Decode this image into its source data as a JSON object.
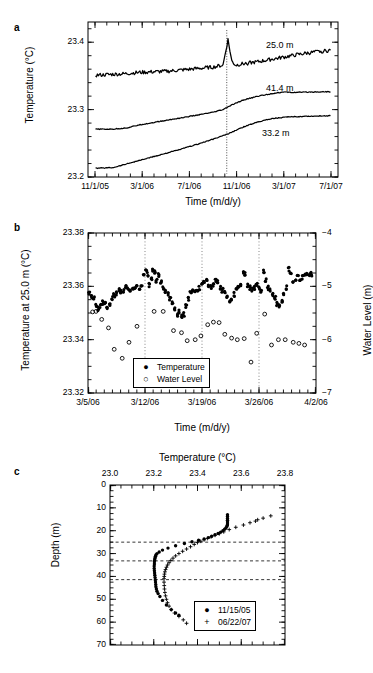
{
  "figure": {
    "panels": [
      "a",
      "b",
      "c"
    ]
  },
  "panel_a": {
    "label": "a",
    "ylabel": "Temperature (°C)",
    "xlabel": "Time (m/d/y)",
    "yticks": [
      "23.2",
      "23.3",
      "23.4"
    ],
    "xticks": [
      "11/1/05",
      "3/1/06",
      "7/1/06",
      "11/1/06",
      "3/1/07",
      "7/1/07"
    ],
    "series_labels": [
      "25.0 m",
      "41.4 m",
      "33.2 m"
    ],
    "chart_data": {
      "type": "line",
      "title": "",
      "xlabel": "Time (m/d/y)",
      "ylabel": "Temperature (°C)",
      "xlim": [
        "11/1/05",
        "7/1/07"
      ],
      "ylim": [
        23.2,
        23.43
      ],
      "yticks": [
        23.2,
        23.3,
        23.4
      ],
      "xtick_labels": [
        "11/1/05",
        "3/1/06",
        "7/1/06",
        "11/1/06",
        "3/1/07",
        "7/1/07"
      ],
      "grid": false,
      "legend": "inline-labels",
      "series": [
        {
          "name": "25.0 m",
          "noisy": true,
          "x": [
            0.03,
            0.08,
            0.14,
            0.2,
            0.26,
            0.32,
            0.38,
            0.44,
            0.5,
            0.54,
            0.56,
            0.575,
            0.59,
            0.62,
            0.68,
            0.74,
            0.8,
            0.86,
            0.92,
            0.97
          ],
          "y": [
            23.351,
            23.352,
            23.353,
            23.355,
            23.356,
            23.357,
            23.359,
            23.361,
            23.363,
            23.366,
            23.404,
            23.372,
            23.366,
            23.368,
            23.371,
            23.375,
            23.379,
            23.383,
            23.386,
            23.388
          ]
        },
        {
          "name": "41.4 m",
          "noisy": false,
          "x": [
            0.03,
            0.1,
            0.16,
            0.2,
            0.28,
            0.36,
            0.44,
            0.5,
            0.54,
            0.57,
            0.62,
            0.68,
            0.74,
            0.78,
            0.82,
            0.88,
            0.94,
            0.97
          ],
          "y": [
            23.271,
            23.271,
            23.273,
            23.277,
            23.282,
            23.287,
            23.292,
            23.296,
            23.3,
            23.306,
            23.314,
            23.32,
            23.324,
            23.326,
            23.3255,
            23.326,
            23.3265,
            23.3265
          ]
        },
        {
          "name": "33.2 m",
          "noisy": false,
          "x": [
            0.03,
            0.1,
            0.14,
            0.2,
            0.28,
            0.36,
            0.44,
            0.5,
            0.56,
            0.62,
            0.68,
            0.74,
            0.8,
            0.86,
            0.92,
            0.97
          ],
          "y": [
            23.213,
            23.214,
            23.218,
            23.224,
            23.232,
            23.24,
            23.249,
            23.256,
            23.264,
            23.274,
            23.282,
            23.287,
            23.289,
            23.29,
            23.2905,
            23.291
          ]
        }
      ],
      "annotations": [
        {
          "text": "dropout spike near 10/1/06",
          "x": 0.555
        }
      ]
    }
  },
  "panel_b": {
    "label": "b",
    "ylabel_left": "Temperature at 25.0 m (°C)",
    "ylabel_right": "Water Level (m)",
    "xlabel": "Time (m/d/y)",
    "yticks_left": [
      "23.38",
      "23.36",
      "23.34",
      "23.32"
    ],
    "yticks_right": [
      "−4",
      "−5",
      "−6",
      "−7"
    ],
    "xticks": [
      "3/5/06",
      "3/12/06",
      "3/19/06",
      "3/26/06",
      "4/2/06"
    ],
    "legend": [
      {
        "symbol": "●",
        "label": "Temperature"
      },
      {
        "symbol": "○",
        "label": "Water Level"
      }
    ],
    "chart_data": {
      "type": "scatter",
      "title": "",
      "xlabel": "Time (m/d/y)",
      "ylabel": "Temperature at 25.0 m (°C)",
      "ylabel_secondary": "Water Level (m)",
      "ylim": [
        23.32,
        23.38
      ],
      "ylim_secondary": [
        -7,
        -4
      ],
      "yticks": [
        23.32,
        23.34,
        23.36,
        23.38
      ],
      "yticks_secondary": [
        -7,
        -6,
        -5,
        -4
      ],
      "xtick_labels": [
        "3/5/06",
        "3/12/06",
        "3/19/06",
        "3/26/06",
        "4/2/06"
      ],
      "grid": "vertical-dotted",
      "legend_position": "lower-center",
      "series": [
        {
          "name": "Temperature",
          "marker": "filled-circle",
          "axis": "left",
          "x": [
            0.005,
            0.015,
            0.025,
            0.035,
            0.045,
            0.055,
            0.065,
            0.075,
            0.085,
            0.095,
            0.105,
            0.115,
            0.125,
            0.135,
            0.145,
            0.155,
            0.165,
            0.175,
            0.185,
            0.195,
            0.205,
            0.215,
            0.225,
            0.235,
            0.245,
            0.255,
            0.262,
            0.27,
            0.278,
            0.285,
            0.292,
            0.3,
            0.31,
            0.32,
            0.33,
            0.34,
            0.35,
            0.36,
            0.37,
            0.38,
            0.39,
            0.4,
            0.41,
            0.42,
            0.43,
            0.44,
            0.45,
            0.46,
            0.47,
            0.48,
            0.49,
            0.5,
            0.51,
            0.52,
            0.53,
            0.54,
            0.55,
            0.56,
            0.57,
            0.58,
            0.59,
            0.6,
            0.61,
            0.62,
            0.63,
            0.64,
            0.65,
            0.66,
            0.67,
            0.68,
            0.69,
            0.7,
            0.71,
            0.72,
            0.73,
            0.74,
            0.75,
            0.76,
            0.77,
            0.78,
            0.79,
            0.8,
            0.81,
            0.82,
            0.83,
            0.84,
            0.85,
            0.86,
            0.87,
            0.88,
            0.89,
            0.9,
            0.91,
            0.92,
            0.93,
            0.94,
            0.95,
            0.96,
            0.97,
            0.98
          ],
          "y": [
            23.3575,
            23.3565,
            23.3555,
            23.353,
            23.3515,
            23.3525,
            23.354,
            23.3535,
            23.352,
            23.3535,
            23.3555,
            23.3565,
            23.3575,
            23.3585,
            23.358,
            23.3585,
            23.3595,
            23.359,
            23.3585,
            23.3595,
            23.36,
            23.3595,
            23.3585,
            23.36,
            23.3645,
            23.3665,
            23.3645,
            23.3605,
            23.3625,
            23.366,
            23.3655,
            23.362,
            23.3645,
            23.3615,
            23.3595,
            23.3585,
            23.357,
            23.3555,
            23.3535,
            23.3515,
            23.3495,
            23.3505,
            23.349,
            23.3495,
            23.3525,
            23.3555,
            23.3575,
            23.3585,
            23.3585,
            23.359,
            23.3595,
            23.3605,
            23.3615,
            23.3625,
            23.3605,
            23.3595,
            23.3605,
            23.3625,
            23.3615,
            23.3595,
            23.3585,
            23.3575,
            23.356,
            23.3545,
            23.3555,
            23.357,
            23.3585,
            23.3595,
            23.3605,
            23.3655,
            23.3645,
            23.3605,
            23.3595,
            23.3585,
            23.3595,
            23.3605,
            23.3595,
            23.3585,
            23.3655,
            23.3625,
            23.3595,
            23.3585,
            23.357,
            23.3555,
            23.3535,
            23.3525,
            23.3545,
            23.3575,
            23.3595,
            23.3665,
            23.3645,
            23.3615,
            23.3625,
            23.3645,
            23.363,
            23.3635,
            23.364,
            23.3645,
            23.3645,
            23.3645
          ]
        },
        {
          "name": "Water Level",
          "marker": "open-circle",
          "axis": "right",
          "x": [
            0.02,
            0.035,
            0.06,
            0.09,
            0.115,
            0.15,
            0.18,
            0.215,
            0.29,
            0.33,
            0.375,
            0.41,
            0.435,
            0.47,
            0.495,
            0.525,
            0.55,
            0.575,
            0.6,
            0.63,
            0.655,
            0.685,
            0.715,
            0.74,
            0.775,
            0.805,
            0.835,
            0.865,
            0.9,
            0.925,
            0.95
          ],
          "y": [
            -5.48,
            -5.47,
            -5.62,
            -5.78,
            -6.18,
            -6.35,
            -6.05,
            -5.75,
            -5.47,
            -5.47,
            -5.83,
            -5.87,
            -6.02,
            -6.0,
            -5.93,
            -5.72,
            -5.67,
            -5.68,
            -5.9,
            -5.97,
            -6.0,
            -5.98,
            -6.42,
            -5.88,
            -5.52,
            -6.1,
            -6.0,
            -6.0,
            -6.05,
            -6.07,
            -6.1
          ]
        }
      ]
    }
  },
  "panel_c": {
    "label": "c",
    "xlabel": "Temperature (°C)",
    "ylabel": "Depth (m)",
    "xticks": [
      "23.0",
      "23.2",
      "23.4",
      "23.6",
      "23.8"
    ],
    "yticks": [
      "0",
      "10",
      "20",
      "30",
      "40",
      "50",
      "60",
      "70"
    ],
    "legend": [
      {
        "symbol": "●",
        "label": "11/15/05"
      },
      {
        "symbol": "+",
        "label": "06/22/07"
      }
    ],
    "chart_data": {
      "type": "scatter",
      "title": "",
      "xlabel": "Temperature (°C)",
      "ylabel": "Depth (m)",
      "xlim": [
        23.0,
        23.8
      ],
      "ylim": [
        70,
        0
      ],
      "xticks": [
        23.0,
        23.2,
        23.4,
        23.6,
        23.8
      ],
      "yticks": [
        0,
        10,
        20,
        30,
        40,
        50,
        60,
        70
      ],
      "x_axis_position": "top",
      "y_axis_inverted": true,
      "grid": false,
      "reference_lines_depth_m": [
        25.0,
        33.2,
        41.4
      ],
      "legend_position": "lower-right",
      "series": [
        {
          "name": "11/15/05",
          "marker": "filled-circle",
          "temperature": [
            23.537,
            23.537,
            23.537,
            23.537,
            23.537,
            23.537,
            23.536,
            23.534,
            23.53,
            23.524,
            23.516,
            23.506,
            23.494,
            23.48,
            23.465,
            23.45,
            23.43,
            23.405,
            23.375,
            23.34,
            23.3,
            23.265,
            23.24,
            23.225,
            23.215,
            23.21,
            23.208,
            23.206,
            23.205,
            23.204,
            23.203,
            23.203,
            23.202,
            23.202,
            23.203,
            23.204,
            23.205,
            23.206,
            23.207,
            23.208,
            23.209,
            23.21,
            23.212,
            23.215,
            23.22,
            23.228,
            23.24,
            23.258,
            23.28,
            23.3,
            23.315
          ],
          "depth": [
            13.0,
            13.8,
            14.6,
            15.4,
            16.2,
            17.0,
            17.6,
            18.2,
            18.8,
            19.4,
            20.0,
            20.6,
            21.2,
            21.8,
            22.4,
            23.0,
            23.6,
            24.2,
            24.8,
            25.6,
            26.6,
            27.6,
            28.5,
            29.3,
            30.0,
            30.6,
            31.2,
            31.8,
            32.4,
            33.0,
            33.6,
            34.5,
            35.5,
            36.5,
            37.5,
            38.5,
            39.5,
            40.5,
            41.5,
            42.5,
            43.5,
            44.5,
            45.5,
            46.5,
            47.5,
            48.8,
            50.5,
            52.5,
            54.5,
            56.0,
            57.0
          ]
        },
        {
          "name": "06/22/07",
          "marker": "plus",
          "temperature": [
            23.735,
            23.7,
            23.675,
            23.665,
            23.64,
            23.61,
            23.575,
            23.545,
            23.52,
            23.5,
            23.48,
            23.462,
            23.445,
            23.43,
            23.415,
            23.4,
            23.385,
            23.368,
            23.35,
            23.332,
            23.315,
            23.3,
            23.288,
            23.278,
            23.27,
            23.263,
            23.258,
            23.254,
            23.251,
            23.249,
            23.248,
            23.247,
            23.247,
            23.248,
            23.249,
            23.251,
            23.254,
            23.258,
            23.263,
            23.27,
            23.28,
            23.295,
            23.315,
            23.335,
            23.35
          ],
          "depth": [
            13.5,
            14.5,
            15.2,
            15.8,
            16.5,
            17.5,
            18.5,
            19.5,
            20.5,
            21.3,
            22.0,
            22.7,
            23.4,
            24.0,
            24.6,
            25.2,
            26.0,
            27.0,
            28.0,
            29.0,
            30.0,
            31.0,
            32.0,
            33.0,
            34.0,
            35.0,
            36.0,
            37.0,
            38.0,
            39.0,
            40.0,
            41.0,
            42.5,
            44.0,
            45.5,
            47.0,
            48.5,
            50.0,
            51.5,
            53.0,
            54.5,
            56.0,
            57.5,
            59.0,
            60.5
          ]
        }
      ]
    }
  }
}
